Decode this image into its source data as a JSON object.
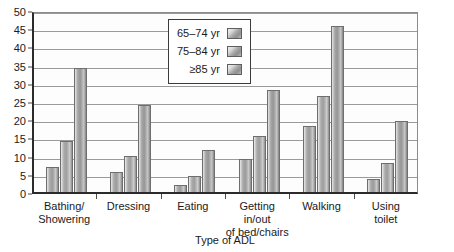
{
  "chart_data": {
    "type": "bar",
    "title": "",
    "xlabel": "Type of ADL",
    "ylabel": "",
    "ylim": [
      0,
      50
    ],
    "ytick_step": 5,
    "yticks": [
      0,
      5,
      10,
      15,
      20,
      25,
      30,
      35,
      40,
      45,
      50
    ],
    "grid": true,
    "legend_position": "upper-center",
    "categories": [
      "Bathing/ Showering",
      "Dressing",
      "Eating",
      "Getting in/out of bed/chairs",
      "Walking",
      "Using toilet"
    ],
    "category_lines": [
      [
        "Bathing/",
        "Showering"
      ],
      [
        "Dressing"
      ],
      [
        "Eating"
      ],
      [
        "Getting in/out",
        "of bed/chairs"
      ],
      [
        "Walking"
      ],
      [
        "Using",
        "toilet"
      ]
    ],
    "series": [
      {
        "name": "65–74 yr",
        "values": [
          7,
          5.5,
          2,
          9,
          18,
          3.5
        ]
      },
      {
        "name": "75–84 yr",
        "values": [
          14,
          10,
          4.5,
          15.5,
          26.5,
          8
        ]
      },
      {
        "name": "≥85 yr",
        "values": [
          34,
          24,
          11.5,
          28,
          45.5,
          19.5
        ]
      }
    ],
    "colors": {
      "bar_face": "#9b9b9b",
      "bar_edge": "#6e6e6e",
      "gridline": "#9a9a9a",
      "axis": "#2b2b2b",
      "text": "#1a1a1a",
      "plot_background": "#fdfdfd"
    }
  },
  "legend": {
    "items": [
      {
        "label": "65–74 yr"
      },
      {
        "label": "75–84 yr"
      },
      {
        "label": "≥85 yr"
      }
    ]
  },
  "axis": {
    "x_title": "Type of ADL"
  }
}
